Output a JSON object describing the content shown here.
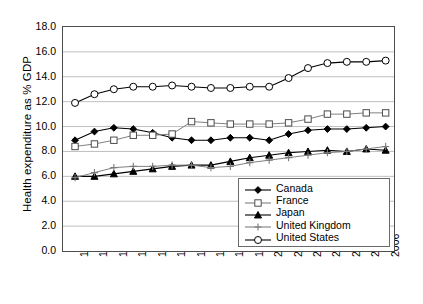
{
  "chart_data": {
    "type": "line",
    "title": "",
    "xlabel": "",
    "ylabel": "Health expenditure as % GDP",
    "ylim": [
      0.0,
      18.0
    ],
    "yticks": [
      "0.0",
      "2.0",
      "4.0",
      "6.0",
      "8.0",
      "10.0",
      "12.0",
      "14.0",
      "16.0",
      "18.0"
    ],
    "ytick_values": [
      0.0,
      2.0,
      4.0,
      6.0,
      8.0,
      10.0,
      12.0,
      14.0,
      16.0,
      18.0
    ],
    "grid": "horizontal",
    "legend_position": "bottom-right",
    "categories": [
      "1990",
      "1991",
      "1992",
      "1993",
      "1994",
      "1995",
      "1996",
      "1997",
      "1998",
      "1999",
      "2000",
      "2001",
      "2002",
      "2003",
      "2004",
      "2005",
      "2006"
    ],
    "x": [
      1990,
      1991,
      1992,
      1993,
      1994,
      1995,
      1996,
      1997,
      1998,
      1999,
      2000,
      2001,
      2002,
      2003,
      2004,
      2005,
      2006
    ],
    "series": [
      {
        "name": "Canada",
        "marker": "filled-diamond",
        "color": "#000000",
        "values": [
          8.9,
          9.6,
          9.9,
          9.8,
          9.5,
          9.1,
          8.9,
          8.9,
          9.1,
          9.1,
          8.9,
          9.4,
          9.7,
          9.8,
          9.8,
          9.9,
          10.0
        ]
      },
      {
        "name": "France",
        "marker": "open-square",
        "color": "#808080",
        "values": [
          8.4,
          8.6,
          8.9,
          9.3,
          9.3,
          9.4,
          10.4,
          10.3,
          10.2,
          10.2,
          10.2,
          10.3,
          10.6,
          11.0,
          11.0,
          11.1,
          11.1
        ]
      },
      {
        "name": "Japan",
        "marker": "filled-triangle",
        "color": "#000000",
        "values": [
          6.0,
          6.0,
          6.2,
          6.4,
          6.6,
          6.8,
          6.9,
          6.9,
          7.2,
          7.5,
          7.7,
          7.9,
          8.0,
          8.1,
          8.0,
          8.2,
          8.1
        ]
      },
      {
        "name": "United Kingdom",
        "marker": "plus",
        "color": "#808080",
        "values": [
          5.9,
          6.3,
          6.7,
          6.8,
          6.8,
          6.9,
          6.9,
          6.7,
          6.8,
          7.1,
          7.3,
          7.5,
          7.7,
          7.9,
          8.0,
          8.2,
          8.4
        ]
      },
      {
        "name": "United States",
        "marker": "open-circle",
        "color": "#000000",
        "values": [
          11.9,
          12.6,
          13.0,
          13.2,
          13.2,
          13.3,
          13.2,
          13.1,
          13.1,
          13.2,
          13.2,
          13.9,
          14.7,
          15.1,
          15.2,
          15.2,
          15.3
        ]
      }
    ]
  },
  "legend": {
    "items": [
      {
        "label": "Canada",
        "marker": "filled-diamond"
      },
      {
        "label": "France",
        "marker": "open-square"
      },
      {
        "label": "Japan",
        "marker": "filled-triangle"
      },
      {
        "label": "United Kingdom",
        "marker": "plus"
      },
      {
        "label": "United States",
        "marker": "open-circle"
      }
    ]
  }
}
